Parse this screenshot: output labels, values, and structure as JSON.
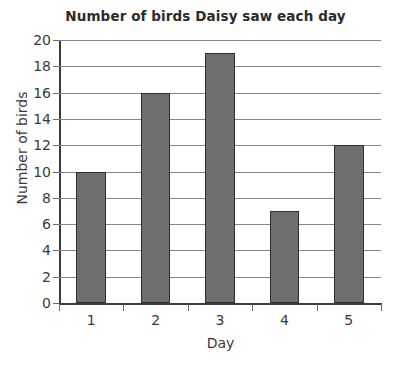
{
  "chart_data": {
    "type": "bar",
    "title": "Number of birds Daisy saw each day",
    "xlabel": "Day",
    "ylabel": "Number of birds",
    "categories": [
      "1",
      "2",
      "3",
      "4",
      "5"
    ],
    "values": [
      10,
      16,
      19,
      7,
      12
    ],
    "ylim": [
      0,
      20
    ],
    "ytick_step": 2,
    "yticks": [
      0,
      2,
      4,
      6,
      8,
      10,
      12,
      14,
      16,
      18,
      20
    ],
    "ytick_labels": [
      "0",
      "2",
      "4",
      "6",
      "8",
      "10",
      "12",
      "14",
      "16",
      "18",
      "20"
    ],
    "grid": true,
    "grid_axis": "y",
    "legend": false,
    "legend_position": "none",
    "bar_color": "#6e6e6e",
    "bar_edge_color": "#2f2f2f",
    "grid_color": "#888888",
    "axis_color": "#3b3b3b",
    "background_color": "#ffffff",
    "title_color": "#2b2b2b",
    "label_color": "#3a3a3a"
  }
}
